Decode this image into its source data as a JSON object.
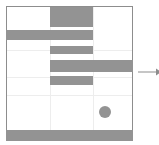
{
  "figure": {
    "width": 159,
    "height": 145,
    "background_color": "#ffffff"
  },
  "frame": {
    "x": 6,
    "y": 6,
    "width": 127,
    "height": 135,
    "border_color": "#8d8d8d",
    "border_width": 1,
    "fill_color": "#ffffff"
  },
  "grid": {
    "color": "#ededed",
    "visible": true,
    "vertical_x": [
      50,
      93
    ],
    "horizontal_y": [
      50,
      77,
      95
    ]
  },
  "marker": {
    "name": "dot-marker",
    "cx": 105,
    "cy": 112,
    "r": 6,
    "color": "#939393"
  },
  "annotation": {
    "name": "right-arrow",
    "x1": 138,
    "y1": 72,
    "x2": 156,
    "y2": 72,
    "color": "#8d8d8d",
    "stroke_width": 1,
    "label": ""
  },
  "chart_data": {
    "type": "bar",
    "orientation": "horizontal",
    "title": "",
    "subtitle": "",
    "xlabel": "",
    "ylabel": "",
    "grid": true,
    "legend": null,
    "bar_color": "#939393",
    "xlim": [
      0,
      159
    ],
    "ylim": [
      0,
      145
    ],
    "categories": [
      "bar-1",
      "bar-2",
      "bar-3",
      "bar-4",
      "bar-5",
      "bar-6"
    ],
    "bars": [
      {
        "name": "bar-1",
        "x": 50,
        "y": 7,
        "width": 43,
        "height": 20,
        "start": 50,
        "end": 93,
        "value": 43
      },
      {
        "name": "bar-2",
        "x": 6,
        "y": 30,
        "width": 87,
        "height": 10,
        "start": 6,
        "end": 93,
        "value": 87
      },
      {
        "name": "bar-3",
        "x": 50,
        "y": 46,
        "width": 43,
        "height": 8,
        "start": 50,
        "end": 93,
        "value": 43
      },
      {
        "name": "bar-4",
        "x": 50,
        "y": 60,
        "width": 83,
        "height": 12,
        "start": 50,
        "end": 133,
        "value": 83
      },
      {
        "name": "bar-5",
        "x": 50,
        "y": 76,
        "width": 43,
        "height": 9,
        "start": 50,
        "end": 93,
        "value": 43
      },
      {
        "name": "bar-6",
        "x": 6,
        "y": 130,
        "width": 127,
        "height": 11,
        "start": 6,
        "end": 133,
        "value": 127
      }
    ],
    "values": [
      43,
      87,
      43,
      83,
      43,
      127
    ],
    "annotations": [
      {
        "type": "arrow",
        "x": 138,
        "y": 72,
        "dx": 18,
        "dy": 0,
        "text": ""
      }
    ],
    "markers": [
      {
        "type": "circle",
        "x": 105,
        "y": 112,
        "size": 12,
        "color": "#939393"
      }
    ]
  }
}
